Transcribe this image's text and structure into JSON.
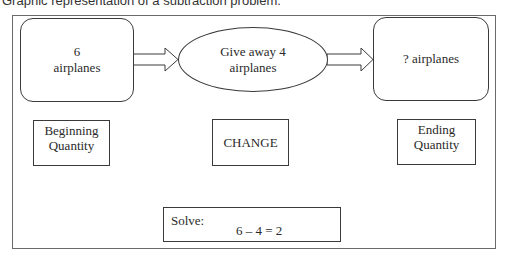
{
  "caption": "Graphic representation of a subtraction problem.",
  "diagram": {
    "start": {
      "line1": "6",
      "line2": "airplanes"
    },
    "change": {
      "line1": "Give away 4",
      "line2": "airplanes"
    },
    "end": {
      "text": "? airplanes"
    },
    "labels": {
      "beginning": {
        "line1": "Beginning",
        "line2": "Quantity"
      },
      "change": "CHANGE",
      "ending": {
        "line1": "Ending",
        "line2": "Quantity"
      }
    },
    "solve": {
      "label": "Solve:",
      "equation": "6 – 4 = 2"
    },
    "arrows": [
      "start-to-change",
      "change-to-end"
    ]
  }
}
